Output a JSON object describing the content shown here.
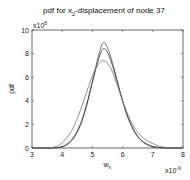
{
  "chart_data": {
    "type": "line",
    "title": "pdf for x2-displacement of node 37",
    "title_main": "pdf for x",
    "title_sub": "2",
    "title_rest": "-displacement of node 37",
    "xlabel": "w",
    "xlabel_sub": "x",
    "ylabel": "pdf",
    "x_exponent": "x10",
    "x_exponent_power": "-9",
    "y_exponent": "x10",
    "y_exponent_power": "8",
    "xlim": [
      3,
      8
    ],
    "ylim": [
      0,
      10
    ],
    "xticks": [
      3,
      4,
      5,
      6,
      7,
      8
    ],
    "yticks": [
      0,
      2,
      4,
      6,
      8,
      10
    ],
    "grid": false,
    "legend": null,
    "series": [
      {
        "name": "curve-1",
        "color": "#555555",
        "x": [
          3.0,
          3.5,
          3.8,
          4.0,
          4.2,
          4.4,
          4.6,
          4.8,
          5.0,
          5.2,
          5.35,
          5.5,
          5.7,
          5.9,
          6.1,
          6.3,
          6.5,
          6.7,
          6.9,
          7.1,
          7.3,
          7.5,
          8.0
        ],
        "values": [
          0.0,
          0.0,
          0.02,
          0.1,
          0.35,
          0.9,
          1.9,
          3.5,
          5.6,
          7.8,
          8.9,
          8.5,
          6.9,
          4.9,
          3.1,
          1.8,
          0.95,
          0.45,
          0.18,
          0.06,
          0.02,
          0.0,
          0.0
        ]
      },
      {
        "name": "curve-2",
        "color": "#333333",
        "x": [
          3.0,
          3.5,
          3.8,
          4.0,
          4.2,
          4.4,
          4.6,
          4.8,
          5.0,
          5.2,
          5.35,
          5.5,
          5.7,
          5.9,
          6.1,
          6.3,
          6.5,
          6.7,
          6.9,
          7.1,
          7.3,
          7.5,
          8.0
        ],
        "values": [
          0.0,
          0.0,
          0.02,
          0.12,
          0.4,
          1.0,
          2.0,
          3.6,
          5.6,
          7.5,
          8.4,
          8.1,
          6.7,
          4.9,
          3.2,
          1.9,
          1.0,
          0.5,
          0.22,
          0.08,
          0.02,
          0.0,
          0.0
        ]
      },
      {
        "name": "curve-3",
        "color": "#777777",
        "x": [
          3.0,
          3.5,
          3.7,
          3.9,
          4.1,
          4.3,
          4.5,
          4.7,
          4.9,
          5.1,
          5.35,
          5.6,
          5.8,
          6.0,
          6.2,
          6.4,
          6.6,
          6.8,
          7.0,
          7.2,
          7.4,
          7.6,
          8.0
        ],
        "values": [
          0.0,
          0.0,
          0.05,
          0.25,
          0.7,
          1.4,
          2.5,
          3.9,
          5.4,
          6.7,
          7.4,
          6.8,
          5.5,
          4.0,
          2.7,
          1.7,
          1.05,
          0.65,
          0.38,
          0.18,
          0.06,
          0.01,
          0.0
        ]
      }
    ]
  }
}
